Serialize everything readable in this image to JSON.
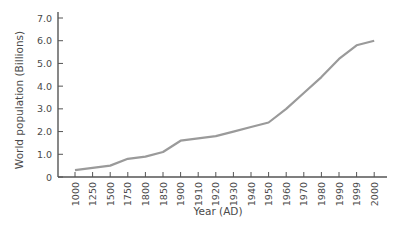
{
  "chart_data": {
    "type": "line",
    "title": "",
    "xlabel": "Year (AD)",
    "ylabel": "World population (Billions)",
    "categories": [
      "1000",
      "1250",
      "1500",
      "1750",
      "1800",
      "1850",
      "1900",
      "1910",
      "1920",
      "1930",
      "1940",
      "1950",
      "1960",
      "1970",
      "1980",
      "1990",
      "1999",
      "2000"
    ],
    "series": [
      {
        "name": "World population",
        "values": [
          0.3,
          0.4,
          0.5,
          0.8,
          0.9,
          1.1,
          1.6,
          1.7,
          1.8,
          2.0,
          2.2,
          2.4,
          3.0,
          3.7,
          4.4,
          5.2,
          5.8,
          6.0
        ],
        "color": "#9a9a9a"
      }
    ],
    "yticks": [
      "0",
      "1.0",
      "2.0",
      "3.0",
      "4.0",
      "5.0",
      "6.0",
      "7.0"
    ],
    "ylim": [
      0,
      7
    ],
    "grid": false,
    "legend": "none"
  },
  "colors": {
    "axis": "#555555",
    "text": "#4a4a4a",
    "line": "#9a9a9a"
  }
}
